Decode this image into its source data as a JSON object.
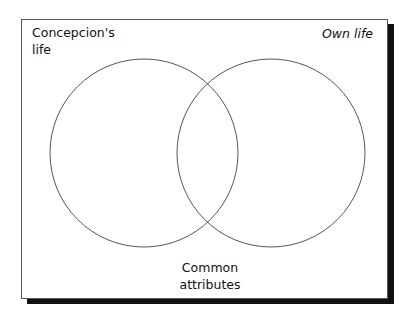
{
  "diagram": {
    "type": "venn",
    "labels": {
      "left_line1": "Concepcion's",
      "left_line2": "life",
      "right": "Own life",
      "common_line1": "Common",
      "common_line2": "attributes"
    },
    "circles": [
      {
        "name": "Concepcion's life",
        "cx": 144,
        "cy": 153,
        "r": 94
      },
      {
        "name": "Own life",
        "cx": 271,
        "cy": 153,
        "r": 94
      }
    ],
    "colors": {
      "stroke": "#555555",
      "shadow": "#111111",
      "background": "#ffffff"
    }
  }
}
